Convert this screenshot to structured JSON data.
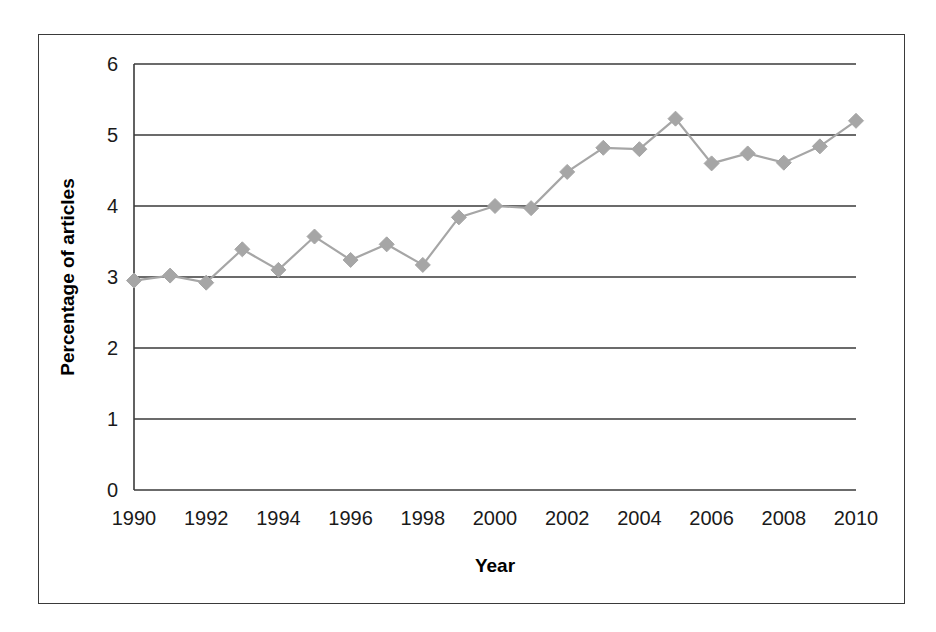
{
  "chart_data": {
    "type": "line",
    "title": "",
    "xlabel": "Year",
    "ylabel": "Percentage of articles",
    "xlim": [
      1990,
      2010
    ],
    "ylim": [
      0,
      6
    ],
    "grid": true,
    "legend": "none",
    "marker": "diamond",
    "series_color": "#a6a6a6",
    "axis_color": "#3a3a3a",
    "x": [
      1990,
      1991,
      1992,
      1993,
      1994,
      1995,
      1996,
      1997,
      1998,
      1999,
      2000,
      2001,
      2002,
      2003,
      2004,
      2005,
      2006,
      2007,
      2008,
      2009,
      2010
    ],
    "values": [
      2.95,
      3.02,
      2.92,
      3.39,
      3.1,
      3.57,
      3.24,
      3.46,
      3.17,
      3.84,
      4.0,
      3.97,
      4.48,
      4.82,
      4.8,
      5.23,
      4.6,
      4.74,
      4.61,
      4.84,
      5.2
    ],
    "y_ticks": [
      0,
      1,
      2,
      3,
      4,
      5,
      6
    ],
    "y_tick_labels": [
      "0",
      "1",
      "2",
      "3",
      "4",
      "5",
      "6"
    ],
    "x_ticks": [
      1990,
      1992,
      1994,
      1996,
      1998,
      2000,
      2002,
      2004,
      2006,
      2008,
      2010
    ],
    "x_tick_labels": [
      "1990",
      "1992",
      "1994",
      "1996",
      "1998",
      "2000",
      "2002",
      "2004",
      "2006",
      "2008",
      "2010"
    ]
  }
}
